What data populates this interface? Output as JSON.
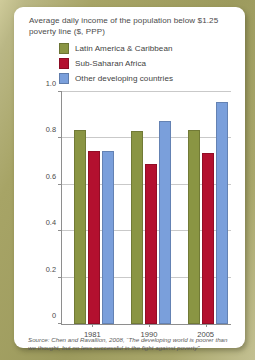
{
  "theme": {
    "frame_color": "#a7a466",
    "card_color": "#ffffff",
    "axis_color": "#8e8e8e",
    "grid_color": "#c9c9c9",
    "text_color": "#4a4a4a"
  },
  "chart_data": {
    "type": "bar",
    "title": "Average daily income of the population below $1.25 poverty line ($, PPP)",
    "xlabel": "",
    "ylabel": "",
    "ylim": [
      0,
      1.0
    ],
    "ytick_labels": [
      "0",
      "0.2",
      "0.4",
      "0.6",
      "0.8",
      "1.0"
    ],
    "ytick_values": [
      0,
      0.2,
      0.4,
      0.6,
      0.8,
      1.0
    ],
    "grid": true,
    "legend_position": "top",
    "categories": [
      "1981",
      "1990",
      "2005"
    ],
    "series": [
      {
        "name": "Latin America & Caribbean",
        "color": "#8a9543",
        "values": [
          0.835,
          0.833,
          0.838
        ]
      },
      {
        "name": "Sub-Saharan Africa",
        "color": "#b3102f",
        "values": [
          0.745,
          0.69,
          0.735
        ]
      },
      {
        "name": "Other developing countries",
        "color": "#7a9fdb",
        "values": [
          0.745,
          0.875,
          0.955
        ]
      }
    ],
    "source": "Source: Chen and Ravallion, 2008, “The developing world is poorer than we thought, but no less successful in the fight against poverty”"
  }
}
